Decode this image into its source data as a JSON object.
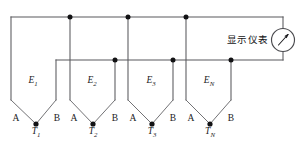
{
  "figure": {
    "type": "circuit-diagram",
    "background_color": "#ffffff",
    "wire_color": "#58585c",
    "node_color": "#121214",
    "text_color": "#1a1a1c",
    "width": 302,
    "height": 158
  },
  "meter": {
    "label": "显示仪表",
    "label_x": 268,
    "label_y": 40,
    "icon": "analog-meter-icon",
    "center_x": 283,
    "center_y": 40,
    "radius": 11.5
  },
  "bus": {
    "top": {
      "y": 17,
      "x_start": 11,
      "x_end": 283
    },
    "middle": {
      "y": 60,
      "x_start": 56,
      "x_end": 283
    },
    "top_nodes_x": [
      70,
      128,
      186
    ],
    "middle_nodes_x": [
      115,
      173,
      231
    ]
  },
  "thermocouples": [
    {
      "emf_label": "E",
      "emf_sub": "1",
      "emf_x": 33,
      "emf_y": 82,
      "terminal_a": "A",
      "terminal_a_x": 16,
      "terminal_b": "B",
      "terminal_b_x": 57,
      "terminal_y": 119,
      "junction_label": "T",
      "junction_sub": "1",
      "junction_x": 36,
      "junction_y": 133,
      "node_x": 36,
      "node_y": 124,
      "left_rail_x": 11,
      "right_rail_x": 56,
      "rail_bottom_y": 100
    },
    {
      "emf_label": "E",
      "emf_sub": "2",
      "emf_x": 92,
      "emf_y": 82,
      "terminal_a": "A",
      "terminal_a_x": 74,
      "terminal_b": "B",
      "terminal_b_x": 115,
      "terminal_y": 119,
      "junction_label": "T",
      "junction_sub": "2",
      "junction_x": 93,
      "junction_y": 133,
      "node_x": 93,
      "node_y": 124,
      "left_rail_x": 70,
      "right_rail_x": 115,
      "rail_bottom_y": 100
    },
    {
      "emf_label": "E",
      "emf_sub": "3",
      "emf_x": 151,
      "emf_y": 82,
      "terminal_a": "A",
      "terminal_a_x": 133,
      "terminal_b": "B",
      "terminal_b_x": 173,
      "terminal_y": 119,
      "junction_label": "T",
      "junction_sub": "3",
      "junction_x": 152,
      "junction_y": 133,
      "node_x": 152,
      "node_y": 124,
      "left_rail_x": 128,
      "right_rail_x": 173,
      "rail_bottom_y": 100
    },
    {
      "emf_label": "E",
      "emf_sub": "N",
      "emf_x": 209,
      "emf_y": 82,
      "terminal_a": "A",
      "terminal_a_x": 191,
      "terminal_b": "B",
      "terminal_b_x": 231,
      "terminal_y": 119,
      "junction_label": "T",
      "junction_sub": "N",
      "junction_x": 210,
      "junction_y": 133,
      "node_x": 210,
      "node_y": 124,
      "left_rail_x": 186,
      "right_rail_x": 231,
      "rail_bottom_y": 100
    }
  ]
}
